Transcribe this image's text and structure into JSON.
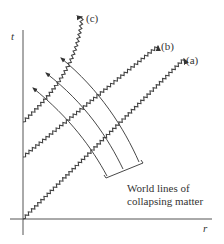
{
  "figure": {
    "axes": {
      "vertical_label": "t",
      "horizontal_label": "r"
    },
    "light_rays": [
      {
        "id": "a",
        "label": "(a)"
      },
      {
        "id": "b",
        "label": "(b)"
      },
      {
        "id": "c",
        "label": "(c)"
      }
    ],
    "annotation": {
      "line1": "World lines of",
      "line2": "collapsing matter"
    },
    "colors": {
      "line": "#444444",
      "background": "#ffffff"
    }
  }
}
